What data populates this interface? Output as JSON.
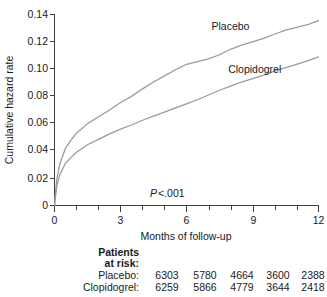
{
  "chart_data": {
    "type": "line",
    "title": "",
    "xlabel": "Months of follow-up",
    "ylabel": "Cumulative hazard rate",
    "xlim": [
      0,
      12
    ],
    "ylim": [
      0,
      0.14
    ],
    "xticks": [
      "0",
      "3",
      "6",
      "9",
      "12"
    ],
    "xtick_values": [
      0,
      3,
      6,
      9,
      12
    ],
    "xminor_step": 1,
    "yticks": [
      "0",
      "0.02",
      "0.04",
      "0.06",
      "0.08",
      "0.10",
      "0.12",
      "0.14"
    ],
    "ytick_values": [
      0,
      0.02,
      0.04,
      0.06,
      0.08,
      0.1,
      0.12,
      0.14
    ],
    "grid": false,
    "legend_position": "inline-labels",
    "annotation": "P <.001",
    "annotation_stat": "P",
    "annotation_rest": " <.001",
    "series": [
      {
        "name": "Placebo",
        "color": "#9a9a9a",
        "x": [
          0,
          0.1,
          0.25,
          0.5,
          0.8,
          1.0,
          1.5,
          2.0,
          2.5,
          3.0,
          3.5,
          4.0,
          4.5,
          5.0,
          5.5,
          6.0,
          6.5,
          7.0,
          7.5,
          8.0,
          8.5,
          9.0,
          9.5,
          10.0,
          10.5,
          11.0,
          11.5,
          12.0
        ],
        "y": [
          0,
          0.019,
          0.031,
          0.042,
          0.049,
          0.053,
          0.06,
          0.065,
          0.07,
          0.0755,
          0.08,
          0.0855,
          0.0905,
          0.095,
          0.0995,
          0.1035,
          0.1055,
          0.1075,
          0.1105,
          0.1145,
          0.1175,
          0.12,
          0.1225,
          0.1255,
          0.1285,
          0.1305,
          0.1325,
          0.1355
        ]
      },
      {
        "name": "Clopidogrel",
        "color": "#9a9a9a",
        "x": [
          0,
          0.1,
          0.25,
          0.5,
          0.8,
          1.0,
          1.5,
          2.0,
          2.5,
          3.0,
          3.5,
          4.0,
          4.5,
          5.0,
          5.5,
          6.0,
          6.5,
          7.0,
          7.5,
          8.0,
          8.5,
          9.0,
          9.5,
          10.0,
          10.5,
          11.0,
          11.5,
          12.0
        ],
        "y": [
          0,
          0.014,
          0.023,
          0.031,
          0.036,
          0.039,
          0.0445,
          0.0485,
          0.0525,
          0.056,
          0.059,
          0.0625,
          0.0655,
          0.0685,
          0.0715,
          0.0745,
          0.0775,
          0.081,
          0.0845,
          0.0875,
          0.0905,
          0.093,
          0.0955,
          0.0985,
          0.101,
          0.1035,
          0.106,
          0.109
        ]
      }
    ],
    "series_labels": [
      {
        "text": "Placebo",
        "x": 8.0,
        "y": 0.1285
      },
      {
        "text": "Clopidogrel",
        "x": 9.1,
        "y": 0.0975
      }
    ]
  },
  "risk_table": {
    "heading_line1": "Patients",
    "heading_line2": "at risk:",
    "rows": [
      {
        "label": "Placebo:",
        "values": [
          "6303",
          "5780",
          "4664",
          "3600",
          "2388"
        ]
      },
      {
        "label": "Clopidogrel:",
        "values": [
          "6259",
          "5866",
          "4779",
          "3644",
          "2418"
        ]
      }
    ]
  },
  "colors": {
    "curve": "#9a9a9a",
    "axis": "#3d3d3d",
    "text": "#1a1a1a",
    "background": "#ffffff"
  }
}
